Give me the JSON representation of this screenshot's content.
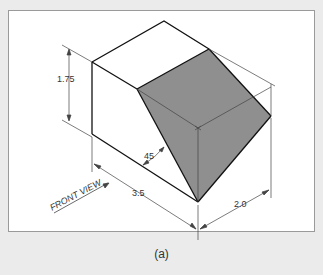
{
  "figure": {
    "caption": "(a)",
    "colors": {
      "background": "#ebebeb",
      "frame": "#ffffff",
      "frame_border": "#9a9a9a",
      "inclined_face": "#8f8f8f",
      "edge": "#111111",
      "dimension_line": "#444444"
    },
    "dimensions": {
      "height": "1.75",
      "length": "3.5",
      "depth": "2.0",
      "angle": "45"
    },
    "view_label": "FRONT VIEW"
  }
}
